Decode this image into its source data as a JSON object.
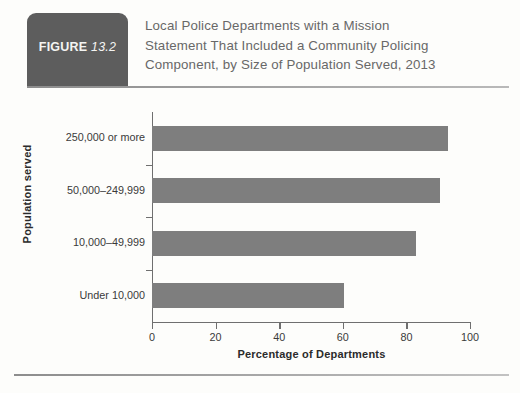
{
  "figure": {
    "badge_word": "FIGURE",
    "badge_number": "13.2",
    "title_line1": "Local Police Departments with a Mission",
    "title_line2": "Statement That Included a Community Policing",
    "title_line3": "Component, by Size of Population Served, 2013"
  },
  "colors": {
    "badge_bg": "#5d5d5d",
    "bar_fill": "#7e7e7e",
    "axis": "#6f6f6f",
    "title_text": "#686868",
    "rule": "#8d8d8d"
  },
  "chart_data": {
    "type": "bar",
    "orientation": "horizontal",
    "title": "Local Police Departments with a Mission Statement That Included a Community Policing Component, by Size of Population Served, 2013",
    "categories": [
      "250,000 or more",
      "50,000–249,999",
      "10,000–49,999",
      "Under 10,000"
    ],
    "values": [
      93,
      90.5,
      83,
      60.5
    ],
    "xlabel": "Percentage of Departments",
    "ylabel": "Population served",
    "xlim": [
      0,
      100
    ],
    "xticks": [
      0,
      20,
      40,
      60,
      80,
      100
    ],
    "xtick_labels": [
      "0",
      "20",
      "40",
      "60",
      "80",
      "100"
    ],
    "grid": false,
    "legend": false,
    "bar_color": "#7e7e7e"
  }
}
